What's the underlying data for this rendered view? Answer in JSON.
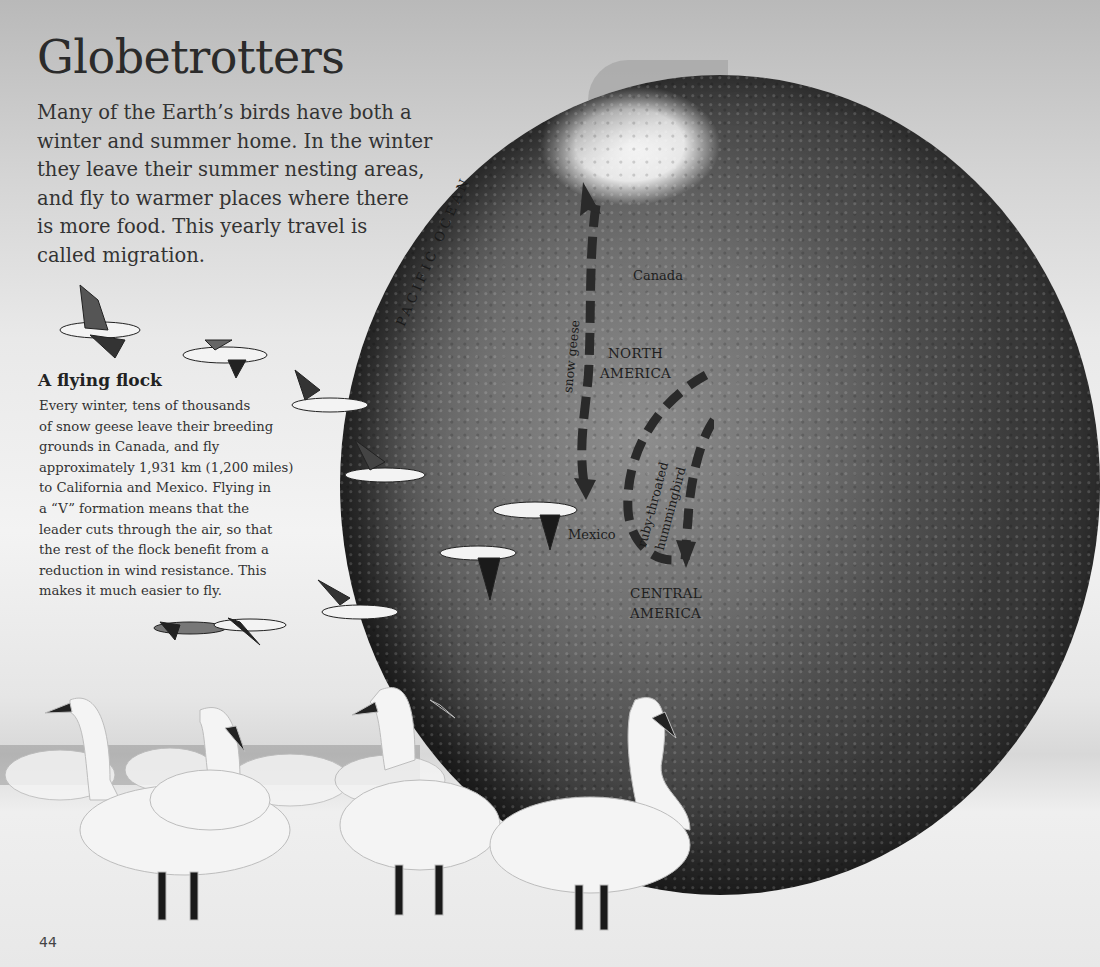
{
  "page": {
    "title": "Globetrotters",
    "intro_lines": [
      "Many of the Earth’s birds have both a",
      "winter and summer home. In the winter",
      "they leave their summer nesting areas,",
      "and fly to warmer places where there",
      "is more food. This yearly travel is",
      "called migration."
    ],
    "section": {
      "heading": "A flying flock",
      "body_lines": [
        "Every winter, tens of thousands",
        "of snow geese leave their breeding",
        "grounds in Canada, and fly",
        "approximately 1,931 km (1,200 miles)",
        "to California and Mexico. Flying in",
        "a “V” formation means that the",
        "leader cuts through the air, so that",
        "the rest of the flock benefit from a",
        "reduction in wind resistance. This",
        "makes it much easier to fly."
      ]
    },
    "page_number": "44"
  },
  "map": {
    "ocean_label": "PACIFIC OCEAN",
    "labels": {
      "canada": "Canada",
      "north_america_1": "NORTH",
      "north_america_2": "AMERICA",
      "mexico": "Mexico",
      "central_america_1": "CENTRAL",
      "central_america_2": "AMERICA"
    },
    "routes": [
      {
        "name": "snow geese",
        "direction": "north-to-south",
        "style": "dashed-arrow"
      },
      {
        "name_line1": "ruby-throated",
        "name_line2": "hummingbird",
        "direction": "loop-south",
        "style": "dashed-arrow"
      }
    ]
  },
  "illustrations": {
    "flying_birds": "snow geese in flight",
    "ground_birds": "swans standing on snow"
  },
  "colors": {
    "text": "#2b2b2b",
    "route_dash": "#2a2a2a",
    "globe_dark": "#3a3a3a",
    "snow": "#f2f2f2"
  }
}
